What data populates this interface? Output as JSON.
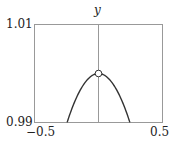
{
  "chart_data": {
    "type": "line",
    "title": "",
    "xlabel": "",
    "ylabel": "y",
    "xlim": [
      -0.5,
      0.5
    ],
    "ylim": [
      0.99,
      1.01
    ],
    "x_ticks": [
      "−0.5",
      "0.5"
    ],
    "y_ticks": [
      "0.99",
      "1.01"
    ],
    "series": [
      {
        "name": "sin(x)/x",
        "x": [
          -0.245,
          -0.2,
          -0.15,
          -0.1,
          -0.05,
          0,
          0.05,
          0.1,
          0.15,
          0.2,
          0.245
        ],
        "y": [
          0.99,
          0.9933,
          0.9963,
          0.9983,
          0.9996,
          1.0,
          0.9996,
          0.9983,
          0.9963,
          0.9933,
          0.99
        ]
      }
    ],
    "annotations": [
      {
        "type": "open-circle",
        "x": 0,
        "y": 1.0,
        "note": "removable discontinuity"
      }
    ],
    "grid": false,
    "legend": "none"
  },
  "labels": {
    "y_axis": "y",
    "y_top": "1.01",
    "y_bottom": "0.99",
    "x_left": "−0.5",
    "x_right": "0.5"
  }
}
